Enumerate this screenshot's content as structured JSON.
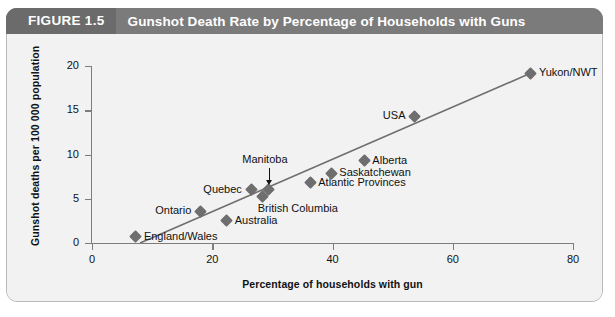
{
  "header": {
    "tag": "FIGURE 1.5",
    "title": "Gunshot Death Rate by Percentage of Households with Guns"
  },
  "chart_data": {
    "type": "scatter",
    "title": "Gunshot Death Rate by Percentage of Households with Guns",
    "xlabel": "Percentage of households with gun",
    "ylabel": "Gunshot deaths per 100 000 population",
    "xlim": [
      0,
      80
    ],
    "ylim": [
      0,
      20
    ],
    "xticks": [
      0,
      20,
      40,
      60,
      80
    ],
    "yticks": [
      0,
      5,
      10,
      15,
      20
    ],
    "grid": false,
    "legend": false,
    "marker_color": "#6e6e6e",
    "trendline_color": "#6e6e6e",
    "trendline": {
      "x": [
        8,
        73
      ],
      "y": [
        0.0,
        19.2
      ]
    },
    "points": [
      {
        "label": "England/Wales",
        "x": 7.3,
        "y": 0.7,
        "label_pos": "right"
      },
      {
        "label": "Ontario",
        "x": 18.0,
        "y": 3.6,
        "label_pos": "left"
      },
      {
        "label": "Australia",
        "x": 22.4,
        "y": 2.5,
        "label_pos": "right"
      },
      {
        "label": "Quebec",
        "x": 26.5,
        "y": 6.0,
        "label_pos": "left"
      },
      {
        "label": "British Columbia",
        "x": 28.4,
        "y": 5.3,
        "label_pos": "below-right"
      },
      {
        "label": "Manitoba",
        "x": 29.4,
        "y": 6.1,
        "label_pos": "callout-above"
      },
      {
        "label": "Atlantic Provinces",
        "x": 36.3,
        "y": 6.8,
        "label_pos": "right"
      },
      {
        "label": "Saskatchewan",
        "x": 39.8,
        "y": 7.9,
        "label_pos": "right"
      },
      {
        "label": "Alberta",
        "x": 45.3,
        "y": 9.3,
        "label_pos": "right"
      },
      {
        "label": "USA",
        "x": 53.7,
        "y": 14.3,
        "label_pos": "left"
      },
      {
        "label": "Yukon/NWT",
        "x": 73.0,
        "y": 19.2,
        "label_pos": "right"
      }
    ]
  }
}
